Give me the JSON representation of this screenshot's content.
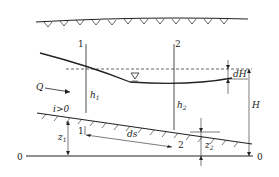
{
  "diagram": {
    "labels": {
      "section1": "1",
      "section2": "2",
      "section1_bed": "1",
      "section2_bed": "2",
      "flow": "Q",
      "slope": "i>0",
      "depth1": "h",
      "depth1_sub": "1",
      "depth2": "h",
      "depth2_sub": "2",
      "elev1": "z",
      "elev1_sub": "1",
      "elev2": "z",
      "elev2_sub": "2",
      "ds": "ds",
      "dH": "dH",
      "H": "H",
      "datum_left": "0",
      "datum_right": "0"
    },
    "colors": {
      "line": "#222222",
      "background": "#ffffff"
    }
  }
}
